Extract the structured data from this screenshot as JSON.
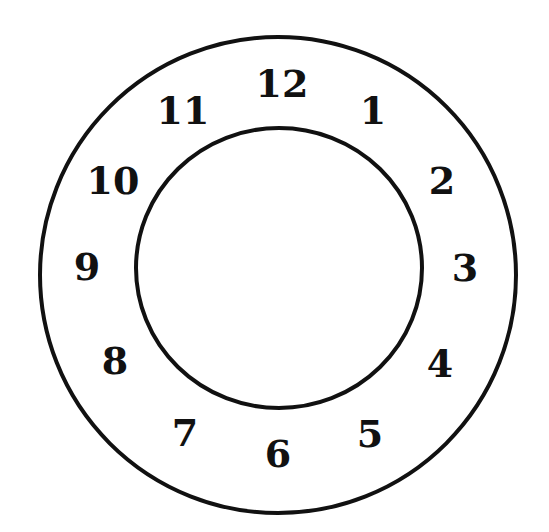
{
  "clock_face": {
    "outer_ring": {
      "cx": 278,
      "cy": 275,
      "r": 238
    },
    "inner_ring": {
      "cx": 279,
      "cy": 268,
      "rx": 143,
      "ry": 140
    },
    "stroke_color": "#111111",
    "background": "#ffffff",
    "numerals": [
      {
        "label": "12",
        "x": 282,
        "y": 83
      },
      {
        "label": "1",
        "x": 373,
        "y": 110
      },
      {
        "label": "2",
        "x": 442,
        "y": 180
      },
      {
        "label": "3",
        "x": 465,
        "y": 267
      },
      {
        "label": "4",
        "x": 440,
        "y": 363
      },
      {
        "label": "5",
        "x": 370,
        "y": 433
      },
      {
        "label": "6",
        "x": 278,
        "y": 453
      },
      {
        "label": "7",
        "x": 185,
        "y": 432
      },
      {
        "label": "8",
        "x": 115,
        "y": 360
      },
      {
        "label": "9",
        "x": 87,
        "y": 266
      },
      {
        "label": "10",
        "x": 113,
        "y": 180
      },
      {
        "label": "11",
        "x": 183,
        "y": 110
      }
    ]
  }
}
